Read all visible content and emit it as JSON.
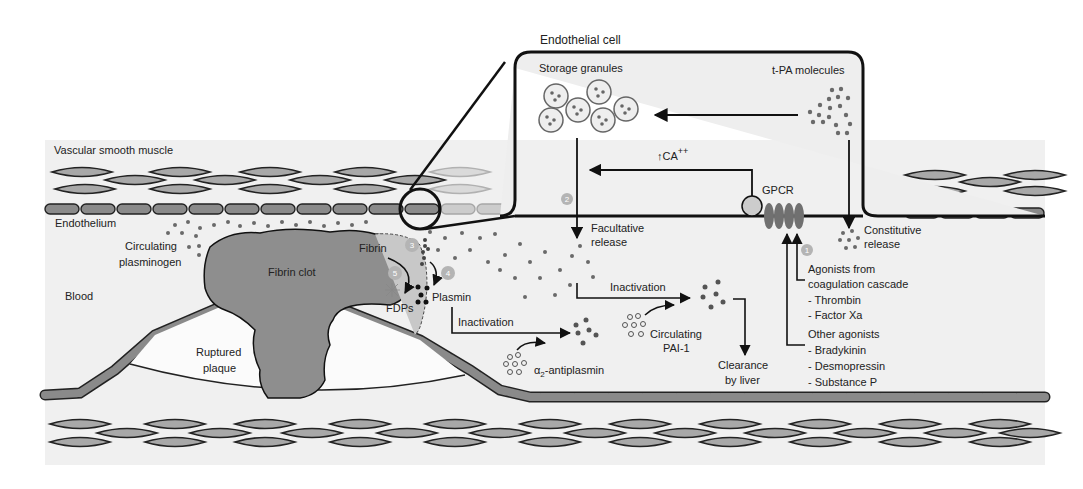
{
  "title": "Endothelial cell",
  "regions": {
    "vascular_smooth_muscle": "Vascular smooth muscle",
    "endothelium": "Endothelium",
    "blood": "Blood"
  },
  "cell": {
    "storage_granules": "Storage granules",
    "tpa_molecules": "t-PA molecules",
    "calcium": "CA",
    "calcium_sup": "++",
    "gpcr": "GPCR"
  },
  "labels": {
    "facultative_release_1": "Facultative",
    "facultative_release_2": "release",
    "constitutive_release_1": "Constitutive",
    "constitutive_release_2": "release",
    "circulating_plasminogen_1": "Circulating",
    "circulating_plasminogen_2": "plasminogen",
    "fibrin_clot": "Fibrin clot",
    "fibrin": "Fibrin",
    "fdps": "FDPs",
    "plasmin": "Plasmin",
    "ruptured_plaque_1": "Ruptured",
    "ruptured_plaque_2": "plaque",
    "inactivation_upper": "Inactivation",
    "inactivation_lower": "Inactivation",
    "circulating_pai1_1": "Circulating",
    "circulating_pai1_2": "PAI-1",
    "antiplasmin_alpha": "α",
    "antiplasmin_sub": "2",
    "antiplasmin_rest": "-antiplasmin",
    "clearance_1": "Clearance",
    "clearance_2": "by liver"
  },
  "agonists": {
    "coagulation_header_1": "Agonists from",
    "coagulation_header_2": "coagulation cascade",
    "coagulation_items": [
      "- Thrombin",
      "- Factor Xa"
    ],
    "other_header": "Other agonists",
    "other_items": [
      "- Bradykinin",
      "- Desmopressin",
      "- Substance P"
    ]
  },
  "steps": [
    "1",
    "2",
    "3",
    "4",
    "5"
  ],
  "colors": {
    "background": "#f0f0f0",
    "cell_fill": "#a8a8a8",
    "cell_stroke": "#222222",
    "clot": "#8e8e8e",
    "step_badge": "#b4b4b4",
    "gpcr": "#707070",
    "dots": "#6a6a6a"
  }
}
